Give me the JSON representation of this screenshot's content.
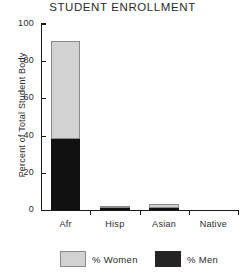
{
  "chart_data": {
    "type": "bar",
    "stacked": true,
    "title": "STUDENT ENROLLMENT",
    "xlabel": "",
    "ylabel": "Percent of Total Student Body",
    "categories": [
      "Afr",
      "Hisp",
      "Asian",
      "Native"
    ],
    "series": [
      {
        "name": "% Men",
        "color": "#111111",
        "values": [
          38,
          1,
          1,
          0
        ]
      },
      {
        "name": "% Women",
        "color": "#d2d2d2",
        "values": [
          53,
          1,
          2,
          0
        ]
      }
    ],
    "totals": [
      91,
      2,
      3,
      0
    ],
    "ylim": [
      0,
      100
    ],
    "yticks": [
      0,
      20,
      40,
      60,
      80,
      100
    ],
    "ytick_labels": [
      "0",
      "20",
      "40",
      "60",
      "80",
      "100"
    ],
    "grid": false,
    "legend_position": "bottom",
    "legend": [
      {
        "label": "% Women",
        "color": "#d2d2d2"
      },
      {
        "label": "% Men",
        "color": "#111111"
      }
    ]
  }
}
